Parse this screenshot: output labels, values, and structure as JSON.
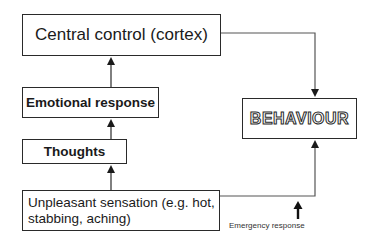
{
  "diagram": {
    "nodes": {
      "central": {
        "label": "Central control (cortex)"
      },
      "emotional": {
        "label": "Emotional response"
      },
      "thoughts": {
        "label": "Thoughts"
      },
      "sensation": {
        "label": "Unpleasant sensation (e.g. hot, stabbing, aching)"
      },
      "behaviour": {
        "label": "BEHAVIOUR"
      }
    },
    "annotations": {
      "emergency": "Emergency response"
    },
    "edges": [
      {
        "from": "sensation",
        "to": "thoughts"
      },
      {
        "from": "thoughts",
        "to": "emotional"
      },
      {
        "from": "emotional",
        "to": "central"
      },
      {
        "from": "central",
        "to": "behaviour"
      },
      {
        "from": "sensation",
        "to": "behaviour"
      }
    ],
    "colors": {
      "stroke": "#2a2a2a",
      "background": "#ffffff"
    }
  }
}
